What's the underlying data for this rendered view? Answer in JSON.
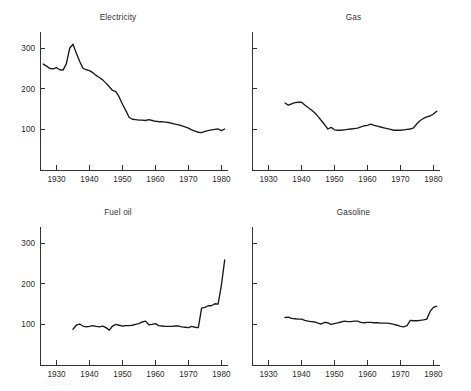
{
  "figure": {
    "width": 471,
    "height": 391,
    "background": "#ffffff",
    "line_color": "#1a1a1a",
    "axis_color": "#333333",
    "caption": "Figure 1"
  },
  "chart_data": [
    {
      "type": "line",
      "title": "Electricity",
      "xlabel": "",
      "ylabel": "",
      "xlim": [
        1925,
        1982
      ],
      "ylim": [
        0,
        340
      ],
      "grid": false,
      "legend": false,
      "xticks": [
        1930,
        1940,
        1950,
        1960,
        1970,
        1980
      ],
      "xticklabels": [
        "1930",
        "1940",
        "1950",
        "1960",
        "1970",
        "1980"
      ],
      "yticks": [
        100,
        200,
        300
      ],
      "yticklabels": [
        "100",
        "200",
        "300"
      ],
      "x": [
        1926,
        1927,
        1928,
        1929,
        1930,
        1931,
        1932,
        1933,
        1934,
        1935,
        1936,
        1937,
        1938,
        1939,
        1940,
        1941,
        1942,
        1943,
        1944,
        1945,
        1946,
        1947,
        1948,
        1949,
        1950,
        1951,
        1952,
        1953,
        1954,
        1955,
        1956,
        1957,
        1958,
        1959,
        1960,
        1961,
        1962,
        1963,
        1964,
        1965,
        1966,
        1967,
        1968,
        1969,
        1970,
        1971,
        1972,
        1973,
        1974,
        1975,
        1976,
        1977,
        1978,
        1979,
        1980,
        1981
      ],
      "values": [
        261,
        256,
        250,
        249,
        252,
        247,
        246,
        262,
        300,
        310,
        288,
        268,
        251,
        247,
        245,
        240,
        233,
        228,
        222,
        214,
        205,
        196,
        193,
        180,
        162,
        147,
        130,
        125,
        124,
        123,
        123,
        122,
        124,
        122,
        120,
        119,
        119,
        118,
        117,
        115,
        113,
        111,
        109,
        106,
        103,
        99,
        96,
        93,
        92,
        95,
        97,
        99,
        100,
        101,
        97,
        101
      ]
    },
    {
      "type": "line",
      "title": "Gas",
      "xlabel": "",
      "ylabel": "",
      "xlim": [
        1925,
        1982
      ],
      "ylim": [
        0,
        340
      ],
      "grid": false,
      "legend": false,
      "xticks": [
        1930,
        1940,
        1950,
        1960,
        1970,
        1980
      ],
      "xticklabels": [
        "1930",
        "1940",
        "1950",
        "1960",
        "1970",
        "1980"
      ],
      "yticks": [
        100,
        200,
        300
      ],
      "yticklabels": [
        "",
        "",
        ""
      ],
      "x": [
        1935,
        1936,
        1937,
        1938,
        1939,
        1940,
        1941,
        1942,
        1943,
        1944,
        1945,
        1946,
        1947,
        1948,
        1949,
        1950,
        1951,
        1952,
        1953,
        1954,
        1955,
        1956,
        1957,
        1958,
        1959,
        1960,
        1961,
        1962,
        1963,
        1964,
        1965,
        1966,
        1967,
        1968,
        1969,
        1970,
        1971,
        1972,
        1973,
        1974,
        1975,
        1976,
        1977,
        1978,
        1979,
        1980,
        1981
      ],
      "values": [
        165,
        160,
        163,
        166,
        167,
        167,
        160,
        154,
        148,
        141,
        132,
        122,
        112,
        101,
        105,
        99,
        98,
        98,
        99,
        100,
        101,
        102,
        103,
        106,
        109,
        110,
        113,
        110,
        108,
        106,
        104,
        102,
        100,
        98,
        98,
        98,
        99,
        100,
        101,
        104,
        114,
        122,
        127,
        131,
        133,
        138,
        145
      ]
    },
    {
      "type": "line",
      "title": "Fuel oil",
      "xlabel": "",
      "ylabel": "",
      "xlim": [
        1925,
        1982
      ],
      "ylim": [
        0,
        340
      ],
      "grid": false,
      "legend": false,
      "xticks": [
        1930,
        1940,
        1950,
        1960,
        1970,
        1980
      ],
      "xticklabels": [
        "1930",
        "1940",
        "1950",
        "1960",
        "1970",
        "1980"
      ],
      "yticks": [
        100,
        200,
        300
      ],
      "yticklabels": [
        "100",
        "200",
        "300"
      ],
      "x": [
        1935,
        1936,
        1937,
        1938,
        1939,
        1940,
        1941,
        1942,
        1943,
        1944,
        1945,
        1946,
        1947,
        1948,
        1949,
        1950,
        1951,
        1952,
        1953,
        1954,
        1955,
        1956,
        1957,
        1958,
        1959,
        1960,
        1961,
        1962,
        1963,
        1964,
        1965,
        1966,
        1967,
        1968,
        1969,
        1970,
        1971,
        1972,
        1973,
        1974,
        1975,
        1976,
        1977,
        1978,
        1979,
        1980,
        1981
      ],
      "values": [
        88,
        98,
        101,
        96,
        94,
        95,
        97,
        95,
        94,
        96,
        92,
        86,
        96,
        100,
        98,
        96,
        97,
        97,
        98,
        100,
        102,
        106,
        108,
        99,
        100,
        102,
        97,
        96,
        95,
        95,
        95,
        96,
        96,
        94,
        93,
        92,
        95,
        93,
        92,
        140,
        142,
        146,
        146,
        151,
        150,
        197,
        259
      ]
    },
    {
      "type": "line",
      "title": "Gasoline",
      "xlabel": "",
      "ylabel": "",
      "xlim": [
        1925,
        1982
      ],
      "ylim": [
        0,
        340
      ],
      "grid": false,
      "legend": false,
      "xticks": [
        1930,
        1940,
        1950,
        1960,
        1970,
        1980
      ],
      "xticklabels": [
        "1930",
        "1940",
        "1950",
        "1960",
        "1970",
        "1980"
      ],
      "yticks": [
        100,
        200,
        300
      ],
      "yticklabels": [
        "",
        "",
        ""
      ],
      "x": [
        1935,
        1936,
        1937,
        1938,
        1939,
        1940,
        1941,
        1942,
        1943,
        1944,
        1945,
        1946,
        1947,
        1948,
        1949,
        1950,
        1951,
        1952,
        1953,
        1954,
        1955,
        1956,
        1957,
        1958,
        1959,
        1960,
        1961,
        1962,
        1963,
        1964,
        1965,
        1966,
        1967,
        1968,
        1969,
        1970,
        1971,
        1972,
        1973,
        1974,
        1975,
        1976,
        1977,
        1978,
        1979,
        1980,
        1981
      ],
      "values": [
        117,
        118,
        115,
        114,
        113,
        113,
        110,
        108,
        107,
        106,
        103,
        101,
        105,
        104,
        100,
        102,
        104,
        106,
        108,
        107,
        107,
        108,
        108,
        105,
        104,
        105,
        105,
        104,
        104,
        103,
        103,
        103,
        102,
        100,
        98,
        95,
        94,
        97,
        110,
        109,
        109,
        110,
        111,
        113,
        132,
        142,
        145
      ]
    }
  ]
}
